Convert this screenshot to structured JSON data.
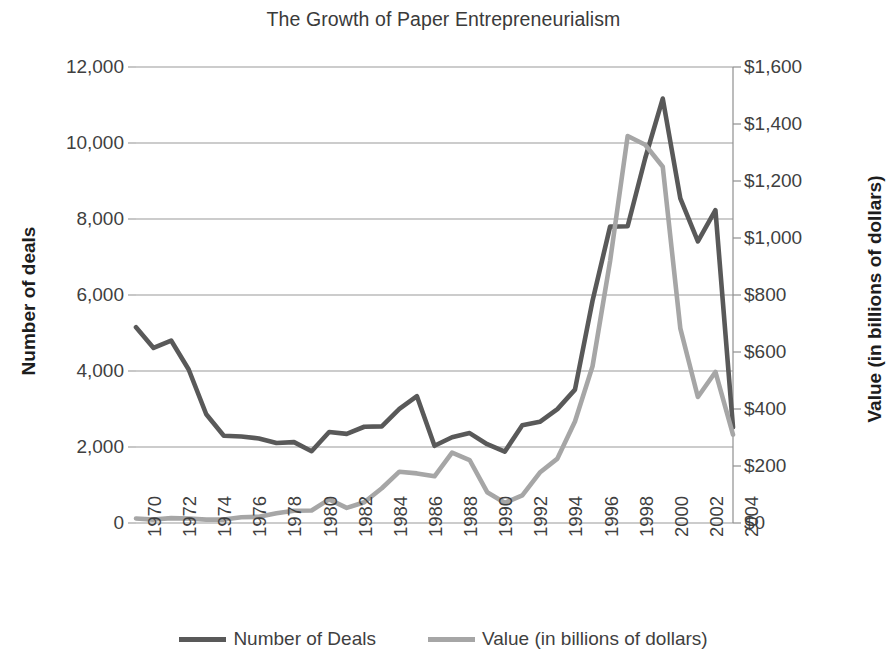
{
  "chart_data": {
    "type": "line",
    "title": "The Growth of Paper Entrepreneurialism",
    "xlabel": "",
    "ylabel": "Number of deals",
    "y2label": "Value (in billions of dollars)",
    "grid": true,
    "legend_position": "bottom",
    "xlim": [
      1970,
      2004
    ],
    "ylim": [
      0,
      12000
    ],
    "y2lim": [
      0,
      1600
    ],
    "x": [
      1970,
      1971,
      1972,
      1973,
      1974,
      1975,
      1976,
      1977,
      1978,
      1979,
      1980,
      1981,
      1982,
      1983,
      1984,
      1985,
      1986,
      1987,
      1988,
      1989,
      1990,
      1991,
      1992,
      1993,
      1994,
      1995,
      1996,
      1997,
      1998,
      1999,
      2000,
      2001,
      2002,
      2003,
      2004
    ],
    "x_tick_labels": [
      "1970",
      "1972",
      "1974",
      "1976",
      "1978",
      "1980",
      "1982",
      "1984",
      "1986",
      "1988",
      "1990",
      "1992",
      "1994",
      "1996",
      "1998",
      "2000",
      "2002",
      "2004"
    ],
    "y_tick_labels": [
      "12,000",
      "10,000",
      "8,000",
      "6,000",
      "4,000",
      "2,000",
      "0"
    ],
    "y_tick_values": [
      12000,
      10000,
      8000,
      6000,
      4000,
      2000,
      0
    ],
    "y2_tick_labels": [
      "$1,600",
      "$1,400",
      "$1,200",
      "$1,000",
      "$800",
      "$600",
      "$400",
      "$200",
      "$0"
    ],
    "y2_tick_values": [
      1600,
      1400,
      1200,
      1000,
      800,
      600,
      400,
      200,
      0
    ],
    "series": [
      {
        "name": "Number of Deals",
        "axis": "left",
        "color": "#595959",
        "values": [
          5152,
          4608,
          4801,
          4040,
          2861,
          2297,
          2276,
          2224,
          2106,
          2128,
          1889,
          2395,
          2346,
          2533,
          2543,
          3001,
          3336,
          2032,
          2258,
          2366,
          2074,
          1877,
          2574,
          2663,
          2997,
          3510,
          5848,
          7800,
          7809,
          9599,
          11169,
          8545,
          7411,
          8232,
          2520
        ]
      },
      {
        "name": "Value (in billions of dollars)",
        "axis": "right",
        "color": "#a6a6a6",
        "values": [
          16,
          12,
          17,
          16,
          12,
          12,
          20,
          22,
          34,
          43,
          44,
          83,
          53,
          73,
          122,
          180,
          174,
          164,
          247,
          221,
          108,
          71,
          97,
          177,
          226,
          356,
          550,
          919,
          1358,
          1327,
          1250,
          683,
          442,
          530,
          310
        ]
      }
    ]
  },
  "legend": {
    "items": [
      {
        "label": "Number of Deals",
        "color": "#595959"
      },
      {
        "label": "Value (in billions of dollars)",
        "color": "#a6a6a6"
      }
    ]
  }
}
